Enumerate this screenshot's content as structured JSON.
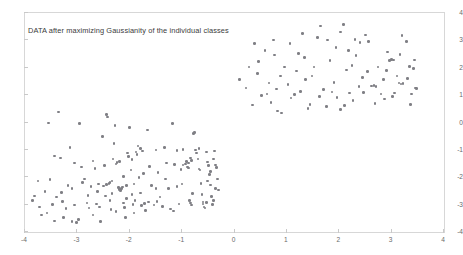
{
  "chart_data": {
    "type": "scatter",
    "title": "DATA after maximizing Gaussianity of the individual classes",
    "xlabel": "",
    "ylabel": "",
    "xlim": [
      -4,
      4
    ],
    "ylim": [
      -4,
      4
    ],
    "grid": false,
    "legend": null,
    "xticks": [
      -4,
      -3,
      -2,
      -1,
      0,
      1,
      2,
      3,
      4
    ],
    "xtick_labels": [
      "-4",
      "-3",
      "-2",
      "-1",
      "0",
      "1",
      "2",
      "3",
      "4"
    ],
    "yticks": [
      -4,
      -3,
      -2,
      -1,
      0,
      1,
      2,
      3,
      4
    ],
    "ytick_labels": [
      "-4",
      "-3",
      "-2",
      "-1",
      "0",
      "1",
      "2",
      "3",
      "4"
    ],
    "marker": "circle",
    "marker_color": "#7f7f85",
    "marker_size": 2.6,
    "frame_color": "#d7d7d7",
    "series": [
      {
        "name": "class-1-lower-left",
        "points": [
          [
            -3.82,
            -2.68
          ],
          [
            -3.75,
            -2.13
          ],
          [
            -3.72,
            -3.08
          ],
          [
            -3.68,
            -3.38
          ],
          [
            -3.62,
            -2.52
          ],
          [
            -3.55,
            -0.02
          ],
          [
            -3.52,
            -2.08
          ],
          [
            -3.48,
            -3.0
          ],
          [
            -3.44,
            -3.6
          ],
          [
            -3.4,
            -2.72
          ],
          [
            -3.36,
            0.38
          ],
          [
            -3.32,
            -1.3
          ],
          [
            -3.28,
            -2.88
          ],
          [
            -3.22,
            -3.14
          ],
          [
            -3.18,
            -2.3
          ],
          [
            -3.14,
            -0.92
          ],
          [
            -3.1,
            -2.42
          ],
          [
            -3.06,
            -3.02
          ],
          [
            -3.02,
            -3.66
          ],
          [
            -2.98,
            -3.54
          ],
          [
            -2.96,
            -0.04
          ],
          [
            -2.92,
            -1.62
          ],
          [
            -2.9,
            -2.2
          ],
          [
            -2.86,
            -2.06
          ],
          [
            -2.82,
            -2.94
          ],
          [
            -2.78,
            -3.12
          ],
          [
            -2.74,
            -2.34
          ],
          [
            -2.7,
            -1.4
          ],
          [
            -2.66,
            -1.68
          ],
          [
            -2.62,
            -2.52
          ],
          [
            -2.58,
            -3.08
          ],
          [
            -2.56,
            -3.62
          ],
          [
            -2.52,
            -0.52
          ],
          [
            -2.48,
            -1.58
          ],
          [
            -2.44,
            0.3
          ],
          [
            -2.42,
            0.2
          ],
          [
            -2.4,
            -2.22
          ],
          [
            -2.38,
            -2.86
          ],
          [
            -2.36,
            -3.18
          ],
          [
            -2.34,
            -2.6
          ],
          [
            -2.32,
            -1.34
          ],
          [
            -2.3,
            -0.76
          ],
          [
            -2.28,
            -0.12
          ],
          [
            -2.26,
            -1.52
          ],
          [
            -2.24,
            -1.46
          ],
          [
            -2.22,
            -2.38
          ],
          [
            -2.2,
            -2.44
          ],
          [
            -2.18,
            -2.48
          ],
          [
            -2.16,
            -2.42
          ],
          [
            -2.14,
            -2.36
          ],
          [
            -2.12,
            -2.94
          ],
          [
            -2.1,
            -3.1
          ],
          [
            -2.08,
            -3.46
          ],
          [
            -2.06,
            -2.78
          ],
          [
            -2.04,
            -1.12
          ],
          [
            -2.02,
            -1.24
          ],
          [
            -2.0,
            -0.18
          ],
          [
            -1.98,
            -1.74
          ],
          [
            -1.96,
            -2.64
          ],
          [
            -1.94,
            -3.0
          ],
          [
            -1.92,
            -3.3
          ],
          [
            -1.9,
            -2.84
          ],
          [
            -1.88,
            -1.08
          ],
          [
            -1.86,
            -1.16
          ],
          [
            -1.84,
            -0.86
          ],
          [
            -1.82,
            -2.0
          ],
          [
            -1.8,
            -2.58
          ],
          [
            -1.78,
            -3.04
          ],
          [
            -1.76,
            -1.04
          ],
          [
            -1.74,
            -1.86
          ],
          [
            -1.72,
            -2.96
          ],
          [
            -1.7,
            -3.22
          ],
          [
            -1.66,
            -0.28
          ],
          [
            -1.62,
            -1.6
          ],
          [
            -1.58,
            -2.3
          ],
          [
            -1.54,
            -3.02
          ],
          [
            -1.5,
            -1.0
          ],
          [
            -1.46,
            -1.82
          ],
          [
            -1.42,
            -2.72
          ],
          [
            -1.38,
            -3.06
          ],
          [
            -1.34,
            -0.92
          ],
          [
            -1.3,
            -1.48
          ],
          [
            -1.26,
            -2.42
          ],
          [
            -1.22,
            -3.16
          ],
          [
            -1.18,
            -0.04
          ],
          [
            -1.14,
            -1.54
          ],
          [
            -1.1,
            -2.34
          ],
          [
            -1.06,
            -2.98
          ],
          [
            -1.02,
            -1.72
          ],
          [
            -0.98,
            -1.56
          ],
          [
            -0.94,
            -1.52
          ],
          [
            -0.9,
            -1.62
          ],
          [
            -0.88,
            -1.66
          ],
          [
            -0.86,
            -2.86
          ],
          [
            -0.84,
            -2.94
          ],
          [
            -0.82,
            -3.02
          ],
          [
            -0.8,
            -2.6
          ],
          [
            -0.78,
            -0.4
          ],
          [
            -0.76,
            -0.36
          ],
          [
            -0.74,
            -1.0
          ],
          [
            -0.72,
            -1.12
          ],
          [
            -0.7,
            -1.34
          ],
          [
            -0.68,
            -1.7
          ],
          [
            -0.66,
            -1.74
          ],
          [
            -0.64,
            -2.22
          ],
          [
            -0.62,
            -2.64
          ],
          [
            -0.6,
            -2.9
          ],
          [
            -0.58,
            -3.08
          ],
          [
            -0.56,
            -3.12
          ],
          [
            -0.54,
            -1.08
          ],
          [
            -0.52,
            -1.44
          ],
          [
            -0.5,
            -1.58
          ],
          [
            -0.48,
            -1.9
          ],
          [
            -0.46,
            -2.28
          ],
          [
            -0.44,
            -2.7
          ],
          [
            -0.42,
            -3.0
          ],
          [
            -0.4,
            -2.84
          ],
          [
            -0.38,
            -1.04
          ],
          [
            -0.36,
            -1.56
          ],
          [
            -0.34,
            -1.64
          ],
          [
            -0.32,
            -2.06
          ],
          [
            -0.3,
            -2.46
          ],
          [
            -3.86,
            -2.84
          ],
          [
            -3.3,
            -2.56
          ],
          [
            -3.05,
            -1.48
          ],
          [
            -2.8,
            -2.66
          ],
          [
            -2.64,
            -2.98
          ],
          [
            -2.46,
            -2.68
          ],
          [
            -2.26,
            -3.26
          ],
          [
            -2.12,
            -1.98
          ],
          [
            -1.96,
            -1.36
          ],
          [
            -1.8,
            -0.94
          ],
          [
            -1.64,
            -2.9
          ],
          [
            -1.48,
            -2.88
          ],
          [
            -1.32,
            -2.06
          ],
          [
            -1.16,
            -3.24
          ],
          [
            -1.0,
            -2.24
          ],
          [
            -0.84,
            -1.3
          ],
          [
            -0.68,
            -0.96
          ],
          [
            -0.52,
            -2.14
          ],
          [
            -0.36,
            -2.42
          ],
          [
            -2.5,
            -2.32
          ],
          [
            -2.44,
            -2.26
          ],
          [
            -2.38,
            -2.2
          ],
          [
            -2.34,
            -2.14
          ],
          [
            -2.2,
            -1.42
          ],
          [
            -2.06,
            -2.3
          ],
          [
            -1.92,
            -2.24
          ],
          [
            -0.92,
            -1.42
          ],
          [
            -0.88,
            -1.48
          ],
          [
            -0.82,
            -1.38
          ],
          [
            -0.6,
            -2.98
          ],
          [
            -0.54,
            -2.92
          ],
          [
            -0.46,
            -1.78
          ],
          [
            -0.4,
            -1.34
          ],
          [
            -2.6,
            -2.24
          ],
          [
            -3.44,
            -1.22
          ],
          [
            -3.26,
            -3.48
          ],
          [
            -3.1,
            -3.62
          ],
          [
            -2.7,
            -3.38
          ],
          [
            -1.5,
            -2.42
          ],
          [
            -1.1,
            -1.02
          ],
          [
            -0.98,
            -0.98
          ],
          [
            -3.58,
            -3.3
          ]
        ]
      },
      {
        "name": "class-2-upper-right",
        "points": [
          [
            0.1,
            1.58
          ],
          [
            0.22,
            1.26
          ],
          [
            0.34,
            0.64
          ],
          [
            0.46,
            2.22
          ],
          [
            0.52,
            0.98
          ],
          [
            0.62,
            1.04
          ],
          [
            0.7,
            0.72
          ],
          [
            0.76,
            2.46
          ],
          [
            0.82,
            0.42
          ],
          [
            0.88,
            1.7
          ],
          [
            0.96,
            2.02
          ],
          [
            1.02,
            1.38
          ],
          [
            1.08,
            0.9
          ],
          [
            1.14,
            1.02
          ],
          [
            1.22,
            2.52
          ],
          [
            1.3,
            3.26
          ],
          [
            1.36,
            1.56
          ],
          [
            1.44,
            0.66
          ],
          [
            1.52,
            2.02
          ],
          [
            1.58,
            3.1
          ],
          [
            1.64,
            3.52
          ],
          [
            1.7,
            1.2
          ],
          [
            1.76,
            0.58
          ],
          [
            1.82,
            2.26
          ],
          [
            1.9,
            1.46
          ],
          [
            1.96,
            0.92
          ],
          [
            2.02,
            3.3
          ],
          [
            2.08,
            3.58
          ],
          [
            2.14,
            1.92
          ],
          [
            2.2,
            1.08
          ],
          [
            2.26,
            0.8
          ],
          [
            2.32,
            2.44
          ],
          [
            2.38,
            1.32
          ],
          [
            2.44,
            1.64
          ],
          [
            2.5,
            3.2
          ],
          [
            2.56,
            2.96
          ],
          [
            2.62,
            1.34
          ],
          [
            2.66,
            1.36
          ],
          [
            2.7,
            1.32
          ],
          [
            2.74,
            2.02
          ],
          [
            2.8,
            1.04
          ],
          [
            2.86,
            0.86
          ],
          [
            2.92,
            2.58
          ],
          [
            2.96,
            2.26
          ],
          [
            3.0,
            2.3
          ],
          [
            3.04,
            2.28
          ],
          [
            3.1,
            1.7
          ],
          [
            3.14,
            1.44
          ],
          [
            3.18,
            1.4
          ],
          [
            3.22,
            1.42
          ],
          [
            3.28,
            2.96
          ],
          [
            3.34,
            2.04
          ],
          [
            3.38,
            1.04
          ],
          [
            3.42,
            1.98
          ],
          [
            3.46,
            1.26
          ],
          [
            3.48,
            1.24
          ],
          [
            0.28,
            2.02
          ],
          [
            0.44,
            1.78
          ],
          [
            0.58,
            2.64
          ],
          [
            0.74,
            3.02
          ],
          [
            0.9,
            0.34
          ],
          [
            1.06,
            2.88
          ],
          [
            1.18,
            1.88
          ],
          [
            1.34,
            2.38
          ],
          [
            1.48,
            1.7
          ],
          [
            1.62,
            0.96
          ],
          [
            1.78,
            3.02
          ],
          [
            1.94,
            2.74
          ],
          [
            2.1,
            0.62
          ],
          [
            2.24,
            2.08
          ],
          [
            2.4,
            2.92
          ],
          [
            2.54,
            1.86
          ],
          [
            2.68,
            0.7
          ],
          [
            2.84,
            1.58
          ],
          [
            3.02,
            0.96
          ],
          [
            3.16,
            2.48
          ],
          [
            3.3,
            1.6
          ],
          [
            3.44,
            2.28
          ],
          [
            0.66,
            1.44
          ],
          [
            1.26,
            1.14
          ],
          [
            1.86,
            1.12
          ],
          [
            2.46,
            1.1
          ],
          [
            3.06,
            1.08
          ],
          [
            0.38,
            2.88
          ],
          [
            2.3,
            3.04
          ],
          [
            3.2,
            3.18
          ],
          [
            1.4,
            0.52
          ],
          [
            2.02,
            0.48
          ],
          [
            3.36,
            0.66
          ],
          [
            0.8,
            1.22
          ],
          [
            2.18,
            2.62
          ],
          [
            2.9,
            1.9
          ]
        ]
      }
    ]
  }
}
